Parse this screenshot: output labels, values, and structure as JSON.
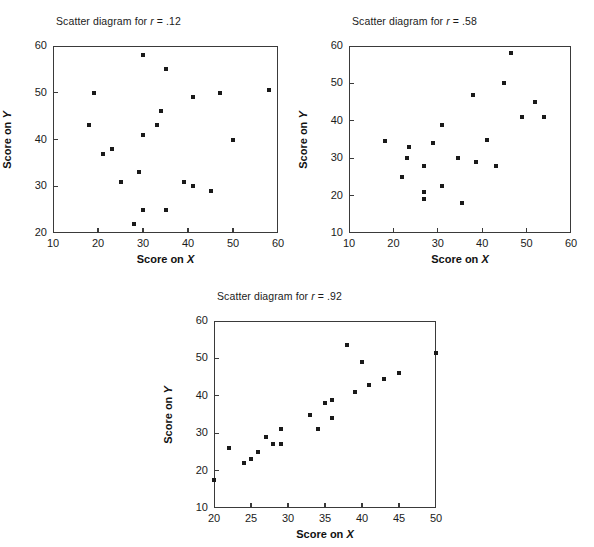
{
  "figure": {
    "width": 594,
    "height": 547,
    "background": "#ffffff",
    "marker_color": "#1a1a1a",
    "axis_color": "#3a3a3a"
  },
  "chart_data": [
    {
      "type": "scatter",
      "id": "panel-r-012",
      "title_prefix": "Scatter diagram for ",
      "title_symbol": "r",
      "title_suffix": " = .12",
      "title": "Scatter diagram for r = .12",
      "xlabel_prefix": "Score on ",
      "xlabel_symbol": "X",
      "xlabel": "Score on X",
      "ylabel_prefix": "Score on ",
      "ylabel_symbol": "Y",
      "ylabel": "Score on Y",
      "xlim": [
        10,
        60
      ],
      "ylim": [
        20,
        60
      ],
      "xticks": [
        10,
        20,
        30,
        40,
        50,
        60
      ],
      "yticks": [
        20,
        30,
        40,
        50,
        60
      ],
      "grid": false,
      "legend": "none",
      "points": [
        [
          18,
          43
        ],
        [
          19,
          50
        ],
        [
          21,
          37
        ],
        [
          23,
          38
        ],
        [
          25,
          31
        ],
        [
          28,
          22
        ],
        [
          29,
          33
        ],
        [
          30,
          25
        ],
        [
          30,
          58
        ],
        [
          30,
          41
        ],
        [
          33,
          43
        ],
        [
          34,
          46
        ],
        [
          35,
          55
        ],
        [
          35,
          25
        ],
        [
          39,
          31
        ],
        [
          41,
          49
        ],
        [
          41,
          30
        ],
        [
          45,
          29
        ],
        [
          47,
          50
        ],
        [
          50,
          40
        ],
        [
          58,
          50.5
        ]
      ]
    },
    {
      "type": "scatter",
      "id": "panel-r-058",
      "title_prefix": "Scatter diagram for ",
      "title_symbol": "r",
      "title_suffix": " = .58",
      "title": "Scatter diagram for r = .58",
      "xlabel_prefix": "Score on ",
      "xlabel_symbol": "X",
      "xlabel": "Score on X",
      "ylabel_prefix": "Score on ",
      "ylabel_symbol": "Y",
      "ylabel": "Score on Y",
      "xlim": [
        10,
        60
      ],
      "ylim": [
        10,
        60
      ],
      "xticks": [
        10,
        20,
        30,
        40,
        50,
        60
      ],
      "yticks": [
        10,
        20,
        30,
        40,
        50,
        60
      ],
      "grid": false,
      "legend": "none",
      "points": [
        [
          18,
          34.5
        ],
        [
          22,
          25
        ],
        [
          23,
          30
        ],
        [
          23.5,
          33
        ],
        [
          27,
          21
        ],
        [
          27,
          19
        ],
        [
          27,
          28
        ],
        [
          29,
          34
        ],
        [
          31,
          39
        ],
        [
          31,
          22.5
        ],
        [
          34.5,
          30
        ],
        [
          35.5,
          18
        ],
        [
          38,
          47
        ],
        [
          38.5,
          29
        ],
        [
          41,
          35
        ],
        [
          43,
          28
        ],
        [
          45,
          50
        ],
        [
          46.5,
          58
        ],
        [
          49,
          41
        ],
        [
          52,
          45
        ],
        [
          54,
          41
        ]
      ]
    },
    {
      "type": "scatter",
      "id": "panel-r-092",
      "title_prefix": "Scatter diagram for ",
      "title_symbol": "r",
      "title_suffix": " = .92",
      "title": "Scatter diagram for r = .92",
      "xlabel_prefix": "Score on ",
      "xlabel_symbol": "X",
      "xlabel": "Score on X",
      "ylabel_prefix": "Score on ",
      "ylabel_symbol": "Y",
      "ylabel": "Score on Y",
      "xlim": [
        20,
        50
      ],
      "ylim": [
        10,
        60
      ],
      "xticks": [
        20,
        25,
        30,
        35,
        40,
        45,
        50
      ],
      "yticks": [
        10,
        20,
        30,
        40,
        50,
        60
      ],
      "grid": false,
      "legend": "none",
      "points": [
        [
          20,
          17.5
        ],
        [
          22,
          26
        ],
        [
          24,
          22
        ],
        [
          25,
          23
        ],
        [
          26,
          25
        ],
        [
          27,
          29
        ],
        [
          28,
          27
        ],
        [
          29,
          27
        ],
        [
          29,
          31
        ],
        [
          33,
          35
        ],
        [
          34,
          31
        ],
        [
          35,
          38
        ],
        [
          36,
          39
        ],
        [
          36,
          34
        ],
        [
          38,
          53.5
        ],
        [
          39,
          41
        ],
        [
          40,
          49
        ],
        [
          41,
          43
        ],
        [
          43,
          44.5
        ],
        [
          45,
          46
        ],
        [
          50,
          51.5
        ]
      ]
    }
  ],
  "layout": [
    {
      "box": {
        "left": 53,
        "top": 46,
        "width": 225,
        "height": 187
      },
      "title_pos": {
        "left": 56,
        "top": 15
      }
    },
    {
      "box": {
        "left": 349,
        "top": 46,
        "width": 222,
        "height": 187
      },
      "title_pos": {
        "left": 352,
        "top": 15
      }
    },
    {
      "box": {
        "left": 214,
        "top": 321,
        "width": 222,
        "height": 187
      },
      "title_pos": {
        "left": 217,
        "top": 290
      }
    }
  ]
}
